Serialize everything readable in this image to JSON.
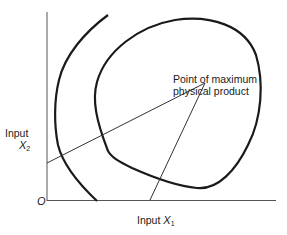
{
  "diagram": {
    "type": "production isoquant diagram",
    "y_axis": {
      "label": "Input",
      "variable": "X",
      "subscript": "2"
    },
    "x_axis": {
      "label": "Input",
      "variable": "X",
      "subscript": "1"
    },
    "origin_label": "O",
    "annotation": {
      "line1": "Point of maximum",
      "line2": "physical product"
    },
    "colors": {
      "curve": "#1a1a1a",
      "axis": "#555555",
      "ridge": "#333333"
    }
  }
}
